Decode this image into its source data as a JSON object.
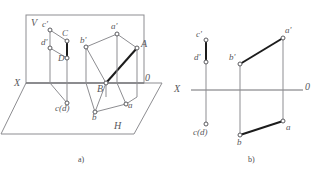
{
  "figure": {
    "title_caption_a": "a)",
    "title_caption_b": "b)",
    "colors": {
      "thin_line": "#8d8d91",
      "thick_line": "#1c1c1c",
      "axis_line": "#6e6e72",
      "label_text": "#58585c",
      "marker_fill": "#ffffff",
      "background": "#ffffff"
    }
  },
  "diagram_a": {
    "caption": "a)",
    "planes": {
      "vertical_plane_label": "V",
      "horizontal_plane_label": "H"
    },
    "axis": {
      "x_label": "X",
      "o_label": "0"
    },
    "points": [
      {
        "name": "c-prime",
        "label": "c'"
      },
      {
        "name": "d-prime",
        "label": "d'"
      },
      {
        "name": "C",
        "label": "C"
      },
      {
        "name": "D",
        "label": "D"
      },
      {
        "name": "c-d-horizontal",
        "label": "c(d)"
      },
      {
        "name": "a-prime",
        "label": "a'"
      },
      {
        "name": "b-prime",
        "label": "b'"
      },
      {
        "name": "A",
        "label": "A"
      },
      {
        "name": "B",
        "label": "B"
      },
      {
        "name": "a",
        "label": "a"
      },
      {
        "name": "b",
        "label": "b"
      }
    ],
    "segments": [
      {
        "name": "CD",
        "emphasis": "thick"
      },
      {
        "name": "AB",
        "emphasis": "thick"
      }
    ]
  },
  "diagram_b": {
    "caption": "b)",
    "axis": {
      "x_label": "X",
      "o_label": "0"
    },
    "points": [
      {
        "name": "c-prime",
        "label": "c'"
      },
      {
        "name": "d-prime",
        "label": "d'"
      },
      {
        "name": "c-d-horizontal",
        "label": "c(d)"
      },
      {
        "name": "a-prime",
        "label": "a'"
      },
      {
        "name": "b-prime",
        "label": "b'"
      },
      {
        "name": "a",
        "label": "a"
      },
      {
        "name": "b",
        "label": "b"
      }
    ],
    "segments": [
      {
        "name": "c-prime-d-prime",
        "emphasis": "thick"
      },
      {
        "name": "a-prime-b-prime",
        "emphasis": "thick"
      },
      {
        "name": "ab",
        "emphasis": "thick"
      }
    ]
  }
}
